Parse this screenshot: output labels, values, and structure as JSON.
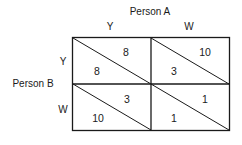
{
  "title": "Person A",
  "column_player": "Person A",
  "row_player": "Person B",
  "columns": [
    "Y",
    "W"
  ],
  "rows": [
    "Y",
    "W"
  ],
  "cells": [
    [
      {
        "upper_right": "8",
        "lower_left": "8"
      },
      {
        "upper_right": "10",
        "lower_left": "3"
      }
    ],
    [
      {
        "upper_right": "3",
        "lower_left": "10"
      },
      {
        "upper_right": "1",
        "lower_left": "1"
      }
    ]
  ],
  "colors": {
    "line": "#1a1a1a",
    "background": "#ffffff"
  }
}
